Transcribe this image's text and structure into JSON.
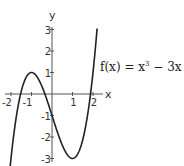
{
  "chart_data": {
    "type": "line",
    "title": "",
    "function": "x^3 - 3x - 1",
    "annotation": {
      "prefix": "f(x) = x",
      "exponent": "3",
      "suffix": " − 3x − 1"
    },
    "xlabel": "x",
    "ylabel": "y",
    "xlim": [
      -2.05,
      2.2
    ],
    "ylim": [
      -3,
      3
    ],
    "x_ticks": [
      {
        "value": -2,
        "label": "-2"
      },
      {
        "value": -1,
        "label": "-1"
      },
      {
        "value": 1,
        "label": "1"
      },
      {
        "value": 2,
        "label": "2"
      }
    ],
    "y_ticks": [
      {
        "value": 3,
        "label": "3"
      },
      {
        "value": 2,
        "label": "2"
      },
      {
        "value": 1,
        "label": "1"
      },
      {
        "value": -1,
        "label": "-1"
      },
      {
        "value": -2,
        "label": "-2"
      },
      {
        "value": -3,
        "label": "-3"
      }
    ],
    "key_points": [
      {
        "x": -2,
        "y": -3
      },
      {
        "x": -1,
        "y": 1,
        "note": "local max"
      },
      {
        "x": 0,
        "y": -1
      },
      {
        "x": 1,
        "y": -3,
        "note": "local min"
      },
      {
        "x": 2,
        "y": 1
      }
    ],
    "grid": false,
    "legend": "none",
    "line_color": "#222222",
    "axis_color": "#555555"
  }
}
